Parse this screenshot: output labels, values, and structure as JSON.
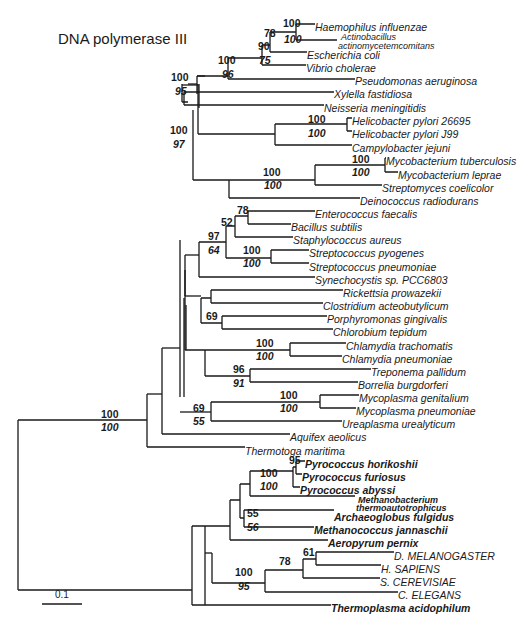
{
  "title": "DNA polymerase III",
  "scale_bar": {
    "label": "0.1"
  },
  "leaves": [
    {
      "name": "Haemophilus influenzae",
      "x": 315,
      "y": 27,
      "bold": false
    },
    {
      "name": "Actinobacillus",
      "x": 341,
      "y": 36,
      "bold": false,
      "small": true
    },
    {
      "name": "actinomycetemcomitans",
      "x": 338,
      "y": 45,
      "bold": false,
      "small": true
    },
    {
      "name": "Escherichia coli",
      "x": 307,
      "y": 55,
      "bold": false
    },
    {
      "name": "Vibrio cholerae",
      "x": 306,
      "y": 68,
      "bold": false
    },
    {
      "name": "Pseudomonas aeruginosa",
      "x": 355,
      "y": 81,
      "bold": false
    },
    {
      "name": "Xylella fastidiosa",
      "x": 334,
      "y": 94,
      "bold": false
    },
    {
      "name": "Neisseria meningitidis",
      "x": 324,
      "y": 108,
      "bold": false
    },
    {
      "name": "Helicobacter pylori 26695",
      "x": 352,
      "y": 121,
      "bold": false
    },
    {
      "name": "Helicobacter pylori J99",
      "x": 352,
      "y": 134,
      "bold": false
    },
    {
      "name": "Campylobacter jejuni",
      "x": 352,
      "y": 148,
      "bold": false
    },
    {
      "name": "Mycobacterium tuberculosis",
      "x": 386,
      "y": 161,
      "bold": false
    },
    {
      "name": "Mycobacterium leprae",
      "x": 398,
      "y": 175,
      "bold": false
    },
    {
      "name": "Streptomyces coelicolor",
      "x": 382,
      "y": 188,
      "bold": false
    },
    {
      "name": "Deinococcus radiodurans",
      "x": 360,
      "y": 201,
      "bold": false
    },
    {
      "name": "Enterococcus faecalis",
      "x": 315,
      "y": 214,
      "bold": false
    },
    {
      "name": "Bacillus subtilis",
      "x": 291,
      "y": 227,
      "bold": false
    },
    {
      "name": "Staphylococcus aureus",
      "x": 293,
      "y": 240,
      "bold": false
    },
    {
      "name": "Streptococcus pyogenes",
      "x": 309,
      "y": 253,
      "bold": false
    },
    {
      "name": "Streptococcus pneumoniae",
      "x": 309,
      "y": 267,
      "bold": false
    },
    {
      "name": "Synechocystis sp. PCC6803",
      "x": 315,
      "y": 280,
      "bold": false
    },
    {
      "name": "Rickettsia prowazekii",
      "x": 343,
      "y": 293,
      "bold": false
    },
    {
      "name": "Clostridium acteobutylicum",
      "x": 323,
      "y": 306,
      "bold": false
    },
    {
      "name": "Porphyromonas gingivalis",
      "x": 327,
      "y": 319,
      "bold": false
    },
    {
      "name": "Chlorobium tepidum",
      "x": 333,
      "y": 332,
      "bold": false
    },
    {
      "name": "Chlamydia trachomatis",
      "x": 346,
      "y": 346,
      "bold": false
    },
    {
      "name": "Chlamydia pneumoniae",
      "x": 342,
      "y": 359,
      "bold": false
    },
    {
      "name": "Treponema pallidum",
      "x": 371,
      "y": 372,
      "bold": false
    },
    {
      "name": "Borrelia burgdorferi",
      "x": 358,
      "y": 385,
      "bold": false
    },
    {
      "name": "Mycoplasma genitalium",
      "x": 359,
      "y": 398,
      "bold": false
    },
    {
      "name": "Mycoplasma pneumoniae",
      "x": 356,
      "y": 411,
      "bold": false
    },
    {
      "name": "Ureaplasma urealyticum",
      "x": 342,
      "y": 424,
      "bold": false
    },
    {
      "name": "Aquifex aeolicus",
      "x": 290,
      "y": 437,
      "bold": false
    },
    {
      "name": "Thermotoga maritima",
      "x": 245,
      "y": 451,
      "bold": false
    },
    {
      "name": "Pyrococcus horikoshii",
      "x": 305,
      "y": 464,
      "bold": true
    },
    {
      "name": "Pyrococcus furiosus",
      "x": 302,
      "y": 477,
      "bold": true
    },
    {
      "name": "Pyrococcus abyssi",
      "x": 300,
      "y": 490,
      "bold": true
    },
    {
      "name": "Methanobacterium",
      "x": 358,
      "y": 499,
      "bold": true,
      "small": true
    },
    {
      "name": "thermoautotrophicus",
      "x": 356,
      "y": 507,
      "bold": true,
      "small": true
    },
    {
      "name": "Archaeoglobus fulgidus",
      "x": 334,
      "y": 517,
      "bold": true
    },
    {
      "name": "Methanococcus jannaschii",
      "x": 314,
      "y": 530,
      "bold": true
    },
    {
      "name": "Aeropyrum pernix",
      "x": 328,
      "y": 543,
      "bold": true
    },
    {
      "name": "D. MELANOGASTER",
      "x": 394,
      "y": 556,
      "bold": false
    },
    {
      "name": "H. SAPIENS",
      "x": 381,
      "y": 569,
      "bold": false
    },
    {
      "name": "S. CEREVISIAE",
      "x": 380,
      "y": 582,
      "bold": false
    },
    {
      "name": "C. ELEGANS",
      "x": 398,
      "y": 595,
      "bold": false
    },
    {
      "name": "Thermoplasma acidophilum",
      "x": 331,
      "y": 608,
      "bold": true
    }
  ],
  "support_values": [
    {
      "text": "100",
      "x": 283,
      "y": 27,
      "italic": false
    },
    {
      "text": "100",
      "x": 284,
      "y": 43,
      "italic": true
    },
    {
      "text": "78",
      "x": 264,
      "y": 37,
      "italic": false
    },
    {
      "text": "90",
      "x": 258,
      "y": 50,
      "italic": false
    },
    {
      "text": "75",
      "x": 259,
      "y": 64,
      "italic": true
    },
    {
      "text": "100",
      "x": 218,
      "y": 64,
      "italic": false
    },
    {
      "text": "96",
      "x": 222,
      "y": 78,
      "italic": true
    },
    {
      "text": "100",
      "x": 171,
      "y": 81,
      "italic": false
    },
    {
      "text": "95",
      "x": 175,
      "y": 95,
      "italic": true
    },
    {
      "text": "100",
      "x": 308,
      "y": 123,
      "italic": false
    },
    {
      "text": "100",
      "x": 308,
      "y": 137,
      "italic": true
    },
    {
      "text": "100",
      "x": 170,
      "y": 134,
      "italic": false
    },
    {
      "text": "97",
      "x": 173,
      "y": 148,
      "italic": true
    },
    {
      "text": "100",
      "x": 352,
      "y": 163,
      "italic": false
    },
    {
      "text": "100",
      "x": 352,
      "y": 176,
      "italic": true
    },
    {
      "text": "100",
      "x": 263,
      "y": 176,
      "italic": false
    },
    {
      "text": "100",
      "x": 264,
      "y": 189,
      "italic": true
    },
    {
      "text": "78",
      "x": 237,
      "y": 214,
      "italic": false
    },
    {
      "text": "52",
      "x": 221,
      "y": 226,
      "italic": false
    },
    {
      "text": "97",
      "x": 208,
      "y": 240,
      "italic": false
    },
    {
      "text": "64",
      "x": 208,
      "y": 254,
      "italic": true
    },
    {
      "text": "100",
      "x": 243,
      "y": 254,
      "italic": false
    },
    {
      "text": "100",
      "x": 243,
      "y": 267,
      "italic": true
    },
    {
      "text": "69",
      "x": 206,
      "y": 320,
      "italic": false
    },
    {
      "text": "100",
      "x": 256,
      "y": 347,
      "italic": false
    },
    {
      "text": "100",
      "x": 256,
      "y": 360,
      "italic": true
    },
    {
      "text": "96",
      "x": 233,
      "y": 373,
      "italic": false
    },
    {
      "text": "91",
      "x": 233,
      "y": 387,
      "italic": true
    },
    {
      "text": "100",
      "x": 280,
      "y": 399,
      "italic": false
    },
    {
      "text": "100",
      "x": 280,
      "y": 412,
      "italic": true
    },
    {
      "text": "69",
      "x": 193,
      "y": 412,
      "italic": false
    },
    {
      "text": "55",
      "x": 193,
      "y": 425,
      "italic": true
    },
    {
      "text": "100",
      "x": 101,
      "y": 418,
      "italic": false
    },
    {
      "text": "100",
      "x": 101,
      "y": 431,
      "italic": true
    },
    {
      "text": "95",
      "x": 289,
      "y": 464,
      "italic": false
    },
    {
      "text": "100",
      "x": 260,
      "y": 477,
      "italic": false
    },
    {
      "text": "100",
      "x": 260,
      "y": 490,
      "italic": true
    },
    {
      "text": "55",
      "x": 247,
      "y": 517,
      "italic": false
    },
    {
      "text": "56",
      "x": 247,
      "y": 531,
      "italic": true
    },
    {
      "text": "61",
      "x": 303,
      "y": 556,
      "italic": false
    },
    {
      "text": "78",
      "x": 279,
      "y": 565,
      "italic": false
    },
    {
      "text": "100",
      "x": 235,
      "y": 576,
      "italic": false
    },
    {
      "text": "95",
      "x": 238,
      "y": 590,
      "italic": true
    }
  ],
  "branches": [
    "M296,24 H315 M296,40 H337 M296,24 V40",
    "M270,32 H296 M270,32 V52 M270,52 H307",
    "M262,45 H270 M262,45 V65 M262,65 H306",
    "M228,58 H262 M228,58 V79 M228,79 H355",
    "M197,76 H228 M197,76 V94",
    "M188,84 H197",
    "M182,102 H188 M182,84 V102",
    "M184,92 H334 M184,92 V105 M184,105 H324",
    "M205,76 H197",
    "M182,85 H198",
    "M347,118 V131 M347,118 H352 M347,131 H352",
    "M275,124 H347 M275,124 V145 M275,145 H352",
    "M198,84 V134 M198,134 H275",
    "M199,108 V84",
    "M385,158 H386 M385,158 V172 M385,172 H398",
    "M315,165 H385 M315,165 V185 M315,185 H382",
    "M229,180 H315 M229,180 V198 M229,198 H360",
    "M193,110 V180 M193,180 H229",
    "M248,211 H315 M248,211 V224 M248,224 H291",
    "M235,216 H248 M235,216 V237 M235,237 H293",
    "M226,226 H235 M226,226 V258",
    "M271,250 H309 M271,250 V263 M271,263 H309",
    "M226,258 H271",
    "M199,242 H226 M199,242 V277 M199,277 H315",
    "M185,255 H199",
    "M185,296 V285 M185,255 V285",
    "M211,290 H343 M211,290 V303 M211,303 H323",
    "M222,316 H327 M222,316 V329 M222,329 H333",
    "M201,298 H211 M201,298 V323 M201,323 H222",
    "M185,296 H201",
    "M185,270 V350 M185,350 H186",
    "M290,343 H346 M290,343 V356 M290,356 H342",
    "M250,369 H371 M250,369 V382 M250,382 H358",
    "M205,350 H290 M205,350 V376 M205,376 H250",
    "M186,305 V350 M186,350 H205",
    "M180,240 V397",
    "M184,298 V397",
    "M320,395 H359 M320,395 V408 M320,408 H356",
    "M211,402 H320 M211,402 V421 M211,421 H342",
    "M180,412 H211",
    "M162,348 V434 M162,434 H290",
    "M162,348 H180",
    "M147,394 V447 M147,447 H245",
    "M147,394 H162",
    "M18,420 V590 M18,420 H147",
    "M296,461 H305 M296,461 V474 M296,474 H302",
    "M293,467 H296 M293,467 V487 M293,487 H300",
    "M250,471 H293 M250,471 V496 M250,496 H355",
    "M244,510 V527",
    "M244,510 H334 M244,527 H314",
    "M240,484 H250 M240,484 V518 M240,518 H244",
    "M230,500 H240 M230,500 V540 M230,540 H328",
    "M205,526 H230 M205,526 V605",
    "M316,552 H394 M316,552 V565 M316,565 H381",
    "M303,559 H316 M303,559 V578 M303,578 H380",
    "M265,570 H303 M265,570 V592 M265,592 H398",
    "M212,583 H265 M212,553 V583",
    "M205,553 H212",
    "M192,590 V605 M192,605 H331",
    "M18,590 H192 M192,590 V526 M192,526 H205"
  ]
}
